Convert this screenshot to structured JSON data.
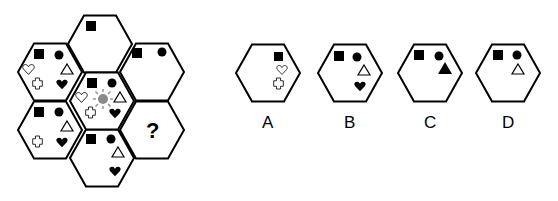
{
  "puzzle": {
    "question_mark": "?",
    "grid": [
      {
        "id": "top",
        "cx": 100,
        "cy": 44,
        "symbols": [
          "black-square"
        ]
      },
      {
        "id": "upper-left",
        "cx": 50,
        "cy": 72,
        "symbols": [
          "black-square",
          "black-circle",
          "white-triangle",
          "white-heart",
          "white-cross",
          "black-heart"
        ]
      },
      {
        "id": "upper-right",
        "cx": 152,
        "cy": 72,
        "symbols": [
          "black-square",
          "black-circle"
        ]
      },
      {
        "id": "center",
        "cx": 102,
        "cy": 101,
        "symbols": [
          "black-square",
          "black-circle",
          "white-triangle",
          "white-heart",
          "gray-sun",
          "white-cross",
          "black-heart"
        ]
      },
      {
        "id": "lower-left",
        "cx": 50,
        "cy": 130,
        "symbols": [
          "black-square",
          "black-circle",
          "white-triangle",
          "white-cross",
          "black-heart"
        ]
      },
      {
        "id": "lower-right",
        "cx": 152,
        "cy": 130,
        "symbols": [
          "question-mark"
        ]
      },
      {
        "id": "bottom",
        "cx": 102,
        "cy": 158,
        "symbols": [
          "black-square",
          "black-circle",
          "white-triangle",
          "black-heart"
        ]
      }
    ]
  },
  "options": [
    {
      "label": "A",
      "symbols": [
        "black-square",
        "white-heart",
        "white-cross"
      ]
    },
    {
      "label": "B",
      "symbols": [
        "black-square",
        "black-circle",
        "white-triangle",
        "black-heart"
      ]
    },
    {
      "label": "C",
      "symbols": [
        "black-square",
        "black-circle",
        "black-triangle"
      ]
    },
    {
      "label": "D",
      "symbols": [
        "black-square",
        "black-circle",
        "white-triangle"
      ]
    }
  ],
  "colors": {
    "stroke": "#000000",
    "sun": "#8a8a8a"
  }
}
